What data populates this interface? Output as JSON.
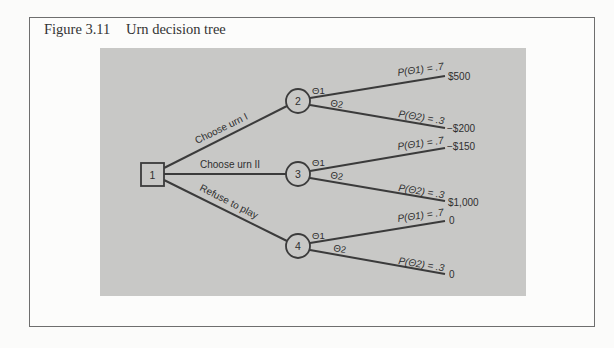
{
  "figure": {
    "number": "Figure 3.11",
    "title": "Urn decision tree"
  },
  "tree": {
    "decision_node": {
      "id": "1",
      "shape": "square"
    },
    "chance_nodes": [
      {
        "id": "2",
        "action_label": "Choose urn I",
        "branches": [
          {
            "state": "Θ1",
            "prob_label": "P(Θ1) = .7",
            "payoff": "$500"
          },
          {
            "state": "Θ2",
            "prob_label": "P(Θ2) = .3",
            "payoff": "−$200"
          }
        ]
      },
      {
        "id": "3",
        "action_label": "Choose urn II",
        "branches": [
          {
            "state": "Θ1",
            "prob_label": "P(Θ1) = .7",
            "payoff": "−$150"
          },
          {
            "state": "Θ2",
            "prob_label": "P(Θ2) = .3",
            "payoff": "$1,000"
          }
        ]
      },
      {
        "id": "4",
        "action_label": "Refuse to play",
        "branches": [
          {
            "state": "Θ1",
            "prob_label": "P(Θ1) = .7",
            "payoff": "0"
          },
          {
            "state": "Θ2",
            "prob_label": "P(Θ2) = .3",
            "payoff": "0"
          }
        ]
      }
    ]
  },
  "colors": {
    "panel": "#c8c8c6",
    "ink": "#3b3b3b",
    "frame": "#6e6e6e"
  }
}
